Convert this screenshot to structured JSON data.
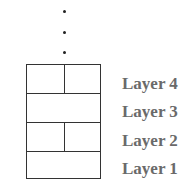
{
  "diagram": {
    "continuation": "ellipsis-vertical",
    "layers": [
      {
        "label": "Layer 4",
        "split": true
      },
      {
        "label": "Layer 3",
        "split": false
      },
      {
        "label": "Layer 2",
        "split": true
      },
      {
        "label": "Layer 1",
        "split": false
      }
    ],
    "colors": {
      "lines": "#333333",
      "labels": "#6a6a6a",
      "background": "#ffffff"
    }
  }
}
